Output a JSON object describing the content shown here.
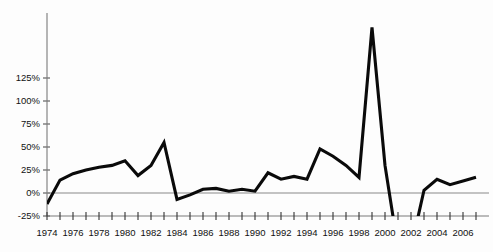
{
  "chart_data": {
    "type": "line",
    "title": "",
    "subtitle": "",
    "xlabel": "",
    "ylabel": "",
    "grid": false,
    "legend": false,
    "legend_position": "none",
    "ylim": [
      -25,
      145
    ],
    "xlim": [
      1974,
      2007
    ],
    "y_tick_values": [
      -25,
      0,
      25,
      50,
      75,
      100,
      125
    ],
    "y_tick_labels": [
      "-25%",
      "0%",
      "25%",
      "50%",
      "75%",
      "100%",
      "125%"
    ],
    "x_tick_values": [
      1974,
      1975,
      1976,
      1977,
      1978,
      1979,
      1980,
      1981,
      1982,
      1983,
      1984,
      1985,
      1986,
      1987,
      1988,
      1989,
      1990,
      1991,
      1992,
      1993,
      1994,
      1995,
      1996,
      1997,
      1998,
      1999,
      2000,
      2001,
      2002,
      2003,
      2004,
      2005,
      2006,
      2007
    ],
    "x_tick_labels": [
      "1974",
      "",
      "1976",
      "",
      "1978",
      "",
      "1980",
      "",
      "1982",
      "",
      "1984",
      "",
      "1986",
      "",
      "1988",
      "",
      "1990",
      "",
      "1992",
      "",
      "1994",
      "",
      "1996",
      "",
      "1998",
      "",
      "2000",
      "",
      "2002",
      "",
      "2004",
      "",
      "2006",
      ""
    ],
    "series": [
      {
        "name": "series-1",
        "color": "#0a0a0a",
        "x": [
          1974,
          1975,
          1976,
          1977,
          1978,
          1979,
          1980,
          1981,
          1982,
          1983,
          1984,
          1985,
          1986,
          1987,
          1988,
          1989,
          1990,
          1991,
          1992,
          1993,
          1994,
          1995,
          1996,
          1997,
          1998,
          1999,
          2000,
          2001,
          2002,
          2003,
          2004,
          2005,
          2006,
          2007
        ],
        "values": [
          -12,
          14,
          21,
          25,
          28,
          30,
          35,
          19,
          30,
          55,
          -7,
          -2,
          4,
          5,
          2,
          4,
          2,
          22,
          15,
          18,
          15,
          48,
          40,
          30,
          17,
          180,
          30,
          -60,
          -60,
          3,
          15,
          9,
          13,
          17
        ]
      }
    ],
    "annotations": [
      {
        "text": "peak clipped above plot top at 1999",
        "x": 1999,
        "y": 145
      },
      {
        "text": "trough clipped below plot bottom between 2001 and 2002",
        "x": 2001.5,
        "y": -25
      }
    ]
  },
  "axes": {
    "y_axis_name": "y-axis",
    "x_axis_name": "x-axis",
    "zero_reference_label": "0%"
  }
}
